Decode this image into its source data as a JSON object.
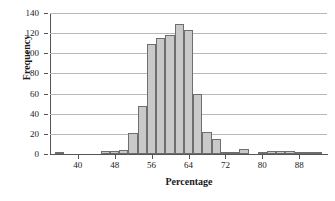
{
  "chart_data": {
    "type": "bar",
    "title": "",
    "xlabel": "Percentage",
    "ylabel": "Frequency",
    "xlim": [
      34,
      94
    ],
    "ylim": [
      0,
      140
    ],
    "bin_width": 2,
    "grid": true,
    "legend": null,
    "x_ticks": [
      40,
      48,
      56,
      64,
      72,
      80,
      88
    ],
    "y_ticks": [
      0,
      20,
      40,
      60,
      80,
      100,
      120,
      140
    ],
    "bar_color": "#c9c9c9",
    "bar_edge_color": "#6e6e6e",
    "gridline_color": "#b9b9b9",
    "axis_color": "#555555",
    "categories": [
      36,
      38,
      40,
      42,
      44,
      46,
      48,
      50,
      52,
      54,
      56,
      58,
      60,
      62,
      64,
      66,
      68,
      70,
      72,
      74,
      76,
      78,
      80,
      82,
      84,
      86,
      88,
      90,
      92
    ],
    "values": [
      2,
      0,
      0,
      0,
      0,
      3,
      3,
      4,
      21,
      48,
      109,
      115,
      118,
      129,
      123,
      60,
      22,
      15,
      2,
      1,
      5,
      0,
      2,
      3,
      3,
      3,
      2,
      1,
      1
    ]
  }
}
